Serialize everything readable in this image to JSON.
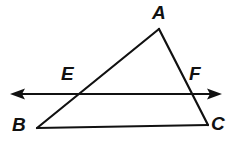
{
  "figure": {
    "type": "geometry-diagram",
    "canvas": {
      "width": 248,
      "height": 141,
      "background": "#ffffff"
    },
    "stroke": {
      "color": "#111111",
      "triangle_width": 2.2,
      "transversal_width": 2.0
    },
    "labels": {
      "A": "A",
      "B": "B",
      "C": "C",
      "E": "E",
      "F": "F"
    },
    "points": {
      "A": {
        "x": 159,
        "y": 29
      },
      "B": {
        "x": 37,
        "y": 128
      },
      "C": {
        "x": 208,
        "y": 125
      },
      "E": {
        "x": 76,
        "y": 94
      },
      "F": {
        "x": 189,
        "y": 94
      }
    },
    "segments": [
      {
        "name": "AB",
        "from": "A",
        "to": "B"
      },
      {
        "name": "AC",
        "from": "A",
        "to": "C"
      },
      {
        "name": "BC",
        "from": "B",
        "to": "C"
      }
    ],
    "transversal": {
      "name": "EF",
      "y": 94,
      "x_start": 10,
      "x_end": 222,
      "arrow_left": true,
      "arrow_right": true
    }
  }
}
